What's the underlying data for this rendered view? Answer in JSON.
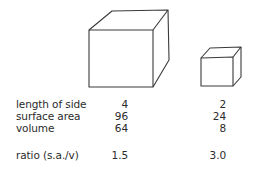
{
  "figure": {
    "cubes": [
      {
        "name": "large-cube",
        "side": 4,
        "front": {
          "x1": 89,
          "y1": 30,
          "x2": 153,
          "y2": 87
        },
        "offset": {
          "dx": 16,
          "dy": -19
        }
      },
      {
        "name": "small-cube",
        "side": 2,
        "front": {
          "x1": 201,
          "y1": 58,
          "x2": 233,
          "y2": 86
        },
        "offset": {
          "dx": 8,
          "dy": -10
        }
      }
    ],
    "line_color": "#3a3a3a"
  },
  "table": {
    "rows": [
      {
        "label": "length of side",
        "large": "4",
        "small": "2"
      },
      {
        "label": "surface area",
        "large": "96",
        "small": "24"
      },
      {
        "label": "volume",
        "large": "64",
        "small": "8"
      },
      {
        "label": "ratio (s.a./v)",
        "large": "1.5",
        "small": "3.0"
      }
    ]
  }
}
